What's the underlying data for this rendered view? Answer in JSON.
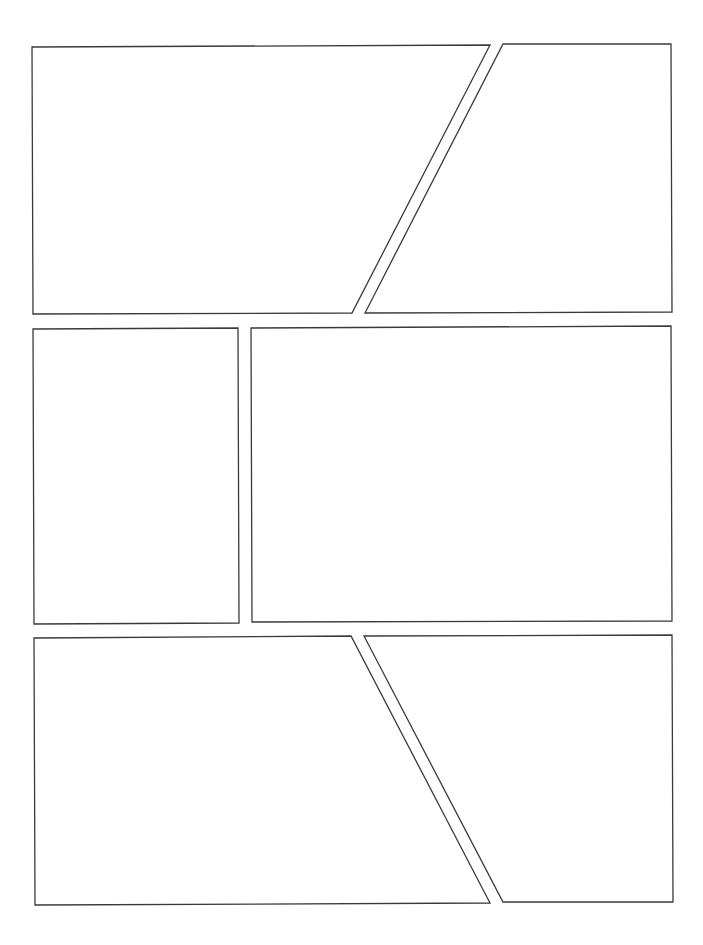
{
  "page": {
    "type": "comic-panel-template",
    "background": "#ffffff",
    "border_color": "#3a3a3a",
    "panel_count": 6
  },
  "panels": [
    {
      "id": "panel-1",
      "row": 1,
      "points": "32,47 490,45 352,313 33,314"
    },
    {
      "id": "panel-2",
      "row": 1,
      "points": "503,44 671,44 672,312 365,313"
    },
    {
      "id": "panel-3",
      "row": 2,
      "points": "33,329 238,328 239,623 34,624"
    },
    {
      "id": "panel-4",
      "row": 2,
      "points": "251,328 671,326 672,621 252,622"
    },
    {
      "id": "panel-5",
      "row": 3,
      "points": "34,638 351,636 490,903 35,905"
    },
    {
      "id": "panel-6",
      "row": 3,
      "points": "364,636 672,635 673,902 503,902"
    }
  ]
}
